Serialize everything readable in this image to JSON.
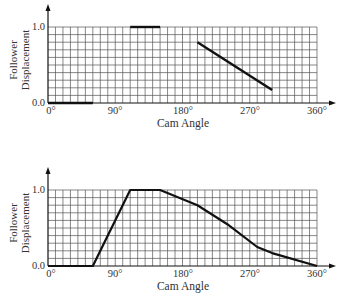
{
  "chart_data": [
    {
      "type": "line",
      "title": "",
      "xlabel": "Cam Angle",
      "ylabel": "Follower Displacement",
      "xlim": [
        0,
        360
      ],
      "ylim": [
        0,
        1.0
      ],
      "x_ticks": [
        "0°",
        "90°",
        "180°",
        "270°",
        "360°"
      ],
      "y_ticks": [
        "0.0",
        "1.0"
      ],
      "grid": true,
      "grid_step_x": 10,
      "grid_step_y": 0.1,
      "segments": [
        {
          "x": [
            0,
            60
          ],
          "y": [
            0.0,
            0.0
          ]
        },
        {
          "x": [
            110,
            150
          ],
          "y": [
            1.0,
            1.0
          ]
        },
        {
          "x": [
            200,
            300
          ],
          "y": [
            0.8,
            0.17
          ]
        }
      ]
    },
    {
      "type": "line",
      "title": "",
      "xlabel": "Cam Angle",
      "ylabel": "Follower Displacement",
      "xlim": [
        0,
        360
      ],
      "ylim": [
        0,
        1.0
      ],
      "x_ticks": [
        "0°",
        "90°",
        "180°",
        "270°",
        "360°"
      ],
      "y_ticks": [
        "0.0",
        "1.0"
      ],
      "grid": true,
      "grid_step_x": 10,
      "grid_step_y": 0.1,
      "series": [
        {
          "name": "Follower Displacement",
          "x": [
            0,
            60,
            110,
            150,
            200,
            240,
            280,
            300,
            360
          ],
          "y": [
            0.0,
            0.0,
            1.0,
            1.0,
            0.8,
            0.55,
            0.25,
            0.17,
            0.0
          ]
        }
      ]
    }
  ],
  "top_chart": {
    "xlabel": "Cam Angle",
    "ylabel_line1": "Follower",
    "ylabel_line2": "Displacement",
    "ytick_top": "1.0",
    "ytick_bottom": "0.0",
    "xticks": [
      "0°",
      "90°",
      "180°",
      "270°",
      "360°"
    ]
  },
  "bottom_chart": {
    "xlabel": "Cam Angle",
    "ylabel_line1": "Follower",
    "ylabel_line2": "Displacement",
    "ytick_top": "1.0",
    "ytick_bottom": "0.0",
    "xticks": [
      "0°",
      "90°",
      "180°",
      "270°",
      "360°"
    ]
  }
}
